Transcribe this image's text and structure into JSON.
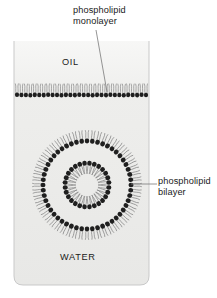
{
  "figure": {
    "labels": {
      "monolayer": "phospholipid\nmonolayer",
      "bilayer": "phospholipid\nbilayer",
      "oil": "OIL",
      "water": "WATER"
    },
    "colors": {
      "lipid_head": "#1f1f1f",
      "lipid_tail": "#8c8c8c",
      "text": "#1a1a1a",
      "leader_line": "#7a7a7a",
      "vessel_stroke": "#c9c9c9",
      "oil_fill": "#f2f2f0",
      "water_fill": "#ebebe9",
      "background": "#ffffff"
    },
    "vessel": {
      "x": 14,
      "y": 41,
      "width": 135,
      "height": 244,
      "corner_radius": 9,
      "interface_y": 92
    },
    "monolayer": {
      "count": 30,
      "head_radius": 2.1,
      "tail_length": 11,
      "head_y": 95,
      "x_start": 17,
      "x_end": 146,
      "orientation": "heads-down-tails-up"
    },
    "liposome": {
      "center_x": 87,
      "center_y": 185,
      "outer_head_radius": 44,
      "inner_head_radius": 22,
      "head_radius": 2.3,
      "outer_count": 52,
      "inner_count": 28
    },
    "leaders": [
      {
        "name": "monolayer-leader",
        "x1": 96,
        "y1": 30,
        "x2": 107,
        "y2": 92
      },
      {
        "name": "bilayer-leader",
        "x1": 131,
        "y1": 184,
        "x2": 157,
        "y2": 184
      }
    ]
  }
}
